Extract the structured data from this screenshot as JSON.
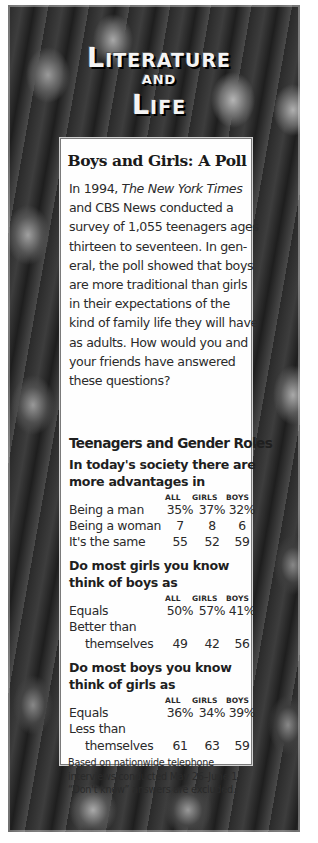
{
  "masthead": {
    "line1_cap": "L",
    "line1_rest": "ITERATURE",
    "line2": "AND",
    "line3_cap": "L",
    "line3_rest": "IFE"
  },
  "sidebar": {
    "title": "Boys and Girls: A Poll",
    "intro": {
      "l1_pre": "In 1994, ",
      "l1_italic": "The New York Times",
      "l2": "and CBS News conducted a",
      "l3": "survey of 1,055 teenagers ages",
      "l4": "thirteen to seventeen. In gen-",
      "l5": "eral, the poll showed that boys",
      "l6": "are more traditional than girls",
      "l7": "in their expectations of the",
      "l8": "kind of family life they will have",
      "l9": "as adults. How would you and",
      "l10": "your friends have answered",
      "l11": "these questions?"
    },
    "table_title": "Teenagers and Gender Roles",
    "columns": [
      "ALL",
      "GIRLS",
      "BOYS"
    ],
    "sections": [
      {
        "question_l1": "In today's society there are",
        "question_l2": "more advantages in",
        "rows": [
          {
            "label": "Being a man",
            "all": "35%",
            "girls": "37%",
            "boys": "32%"
          },
          {
            "label": "Being a woman",
            "all": "7",
            "girls": "8",
            "boys": "6"
          },
          {
            "label": "It's the same",
            "all": "55",
            "girls": "52",
            "boys": "59"
          }
        ]
      },
      {
        "question_l1": "Do most girls you know",
        "question_l2": "think of boys as",
        "rows": [
          {
            "label": "Equals",
            "all": "50%",
            "girls": "57%",
            "boys": "41%"
          },
          {
            "label": "Better than",
            "all": "",
            "girls": "",
            "boys": ""
          },
          {
            "label": "themselves",
            "all": "49",
            "girls": "42",
            "boys": "56"
          }
        ]
      },
      {
        "question_l1": "Do most boys you know",
        "question_l2": "think of girls as",
        "rows": [
          {
            "label": "Equals",
            "all": "36%",
            "girls": "34%",
            "boys": "39%"
          },
          {
            "label": "Less than",
            "all": "",
            "girls": "",
            "boys": ""
          },
          {
            "label": "themselves",
            "all": "61",
            "girls": "63",
            "boys": "59"
          }
        ]
      }
    ],
    "note": {
      "l1": "Based on nationwide telephone",
      "l2": "interviews conducted May 26–June 1.",
      "l3": "“Don't know” answers are excluded."
    }
  }
}
